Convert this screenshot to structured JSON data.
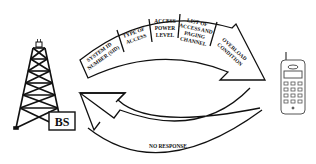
{
  "diagram": {
    "type": "cyclic-flow",
    "background": "#ffffff",
    "stroke_color": "#111111",
    "base_station": {
      "label": "BS",
      "icon": "cell-tower-icon"
    },
    "mobile": {
      "icon": "mobile-phone-icon"
    },
    "forward_arrow": {
      "direction": "base-station-to-mobile",
      "segments": [
        {
          "id": "sid",
          "lines": [
            "SYSTEM ID",
            "NUMBER (SID)"
          ]
        },
        {
          "id": "access-type",
          "lines": [
            "TYPE OF",
            "ACCESS"
          ]
        },
        {
          "id": "power",
          "lines": [
            "ACCESS",
            "POWER",
            "LEVEL"
          ]
        },
        {
          "id": "channels",
          "lines": [
            "LIST OF",
            "ACCESS AND",
            "PAGING",
            "CHANNEL"
          ]
        },
        {
          "id": "overload",
          "lines": [
            "OVERLOAD",
            "CONDITION"
          ]
        }
      ]
    },
    "return_arrow": {
      "direction": "mobile-to-base-station",
      "label": "NO RESPONSE"
    }
  }
}
